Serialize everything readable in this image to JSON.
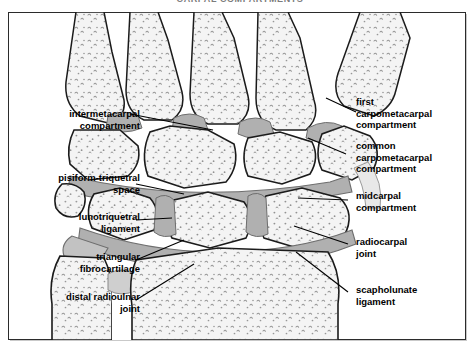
{
  "figure": {
    "title_clipped": "CARPAL COMPARTMENTS",
    "view": "coronal",
    "frame_color": "#2b2b2b",
    "bone_fill": "#f4f4f4",
    "cartilage_fill": "#b0b0b0",
    "outline_color": "#1a1a1a"
  },
  "labels": {
    "left": [
      {
        "id": "intermetacarpal-compartment",
        "text": "intermetacarpal\ncompartment"
      },
      {
        "id": "pisiform-triquetral-space",
        "text": "pisiform-triquetral\nspace"
      },
      {
        "id": "lunotriquetral-ligament",
        "text": "lunotriquetral\nligament"
      },
      {
        "id": "triangular-fibrocartilage",
        "text": "triangular\nfibrocartilage"
      },
      {
        "id": "distal-radioulnar-joint",
        "text": "distal radioulnar\njoint"
      }
    ],
    "right": [
      {
        "id": "first-carpometacarpal-compartment",
        "text": "first\ncarpometacarpal\ncompartment"
      },
      {
        "id": "common-carpometacarpal-compartment",
        "text": "common\ncarpometacarpal\ncompartment"
      },
      {
        "id": "midcarpal-compartment",
        "text": "midcarpal\ncompartment"
      },
      {
        "id": "radiocarpal-joint",
        "text": "radiocarpal\njoint"
      },
      {
        "id": "scapholunate-ligament",
        "text": "scapholunate\nligament"
      }
    ]
  }
}
